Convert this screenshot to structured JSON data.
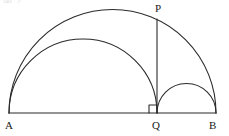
{
  "figure": {
    "width": 229,
    "height": 136,
    "background_color": "#ffffff",
    "stroke_color": "#2b2b2b",
    "label_color": "#1a1a1a",
    "header_fragment": "図 2",
    "labels": {
      "A": "A",
      "B": "B",
      "Q": "Q",
      "P": "P"
    }
  },
  "chart_data": {
    "type": "diagram",
    "title": "",
    "points": [
      {
        "name": "A",
        "x": 9,
        "y": 113,
        "label": "A",
        "label_pos": "below-left"
      },
      {
        "name": "Q",
        "x": 157,
        "y": 113,
        "label": "Q",
        "label_pos": "below"
      },
      {
        "name": "B",
        "x": 216,
        "y": 113,
        "label": "B",
        "label_pos": "below-right"
      },
      {
        "name": "P",
        "x": 157,
        "y": 19,
        "label": "P",
        "label_pos": "above"
      }
    ],
    "segments": [
      {
        "name": "baseline-AB",
        "from": "A",
        "to": "B",
        "x1": 9,
        "y1": 113,
        "x2": 216,
        "y2": 113
      },
      {
        "name": "perpendicular-QP",
        "from": "Q",
        "to": "P",
        "x1": 157,
        "y1": 19,
        "x2": 157,
        "y2": 113
      }
    ],
    "semicircles": [
      {
        "name": "large-semicircle-AB",
        "diameter_from": "A",
        "diameter_to": "B",
        "cx": 112.5,
        "cy": 113,
        "r": 103.5
      },
      {
        "name": "medium-semicircle-AQ",
        "diameter_from": "A",
        "diameter_to": "Q",
        "cx": 83,
        "cy": 113,
        "r": 74
      },
      {
        "name": "small-semicircle-QB",
        "diameter_from": "Q",
        "diameter_to": "B",
        "cx": 186.5,
        "cy": 113,
        "r": 29.5
      }
    ],
    "markers": [
      {
        "name": "right-angle-at-Q",
        "at": "Q",
        "type": "right-angle-square",
        "size": 8,
        "side": "left"
      }
    ]
  }
}
